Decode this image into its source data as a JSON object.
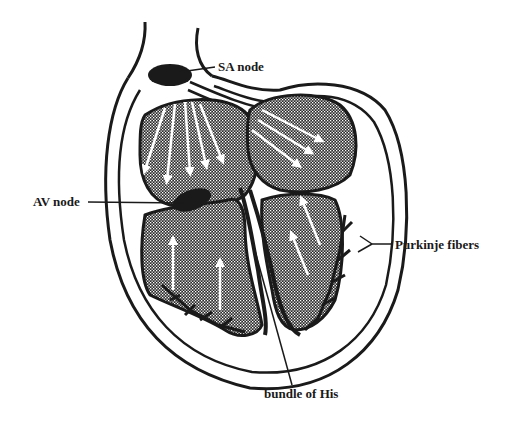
{
  "diagram": {
    "labels": {
      "sa_node": "SA node",
      "av_node": "AV node",
      "purkinje_fibers": "Purkinje fibers",
      "bundle_of_his": "bundle of His"
    },
    "colors": {
      "ink": "#1a1a1a",
      "background": "#ffffff",
      "chamber_fill": "#3a3a3a"
    }
  }
}
